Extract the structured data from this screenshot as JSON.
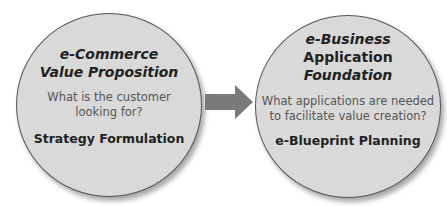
{
  "left_circle": {
    "title_line1": "e-Commerce",
    "title_line2": "Value Proposition",
    "question_line1": "What is the customer",
    "question_line2": "looking for?",
    "subtitle": "Strategy Formulation"
  },
  "right_circle": {
    "title_line1": "e-Business",
    "title_line2": "Application",
    "title_line3": "Foundation",
    "question_line1": "What applications are needed",
    "question_line2": "to facilitate value creation?",
    "subtitle": "e-Blueprint Planning"
  },
  "arrow": {
    "icon": "right-arrow-icon",
    "color": "#7a7a7a"
  },
  "colors": {
    "circle_fill": "#d9d9d9",
    "circle_border": "#555555"
  }
}
